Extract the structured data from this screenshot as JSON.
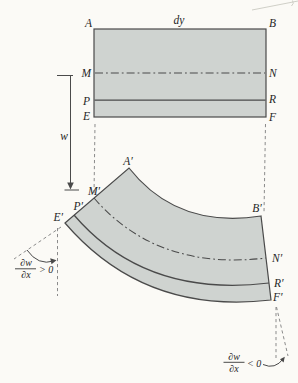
{
  "figure_labels": {
    "undeformed": {
      "A": "A",
      "dy": "dy",
      "B": "B",
      "M": "M",
      "N": "N",
      "P": "P",
      "R": "R",
      "E": "E",
      "F": "F"
    },
    "deflection": {
      "w": "w"
    },
    "deformed": {
      "A_prime": "A′",
      "B_prime": "B′",
      "M_prime": "M′",
      "N_prime": "N′",
      "P_prime": "P′",
      "R_prime": "R′",
      "E_prime": "E′",
      "F_prime": "F′"
    },
    "slope_left": {
      "numerator": "∂w",
      "denominator": "∂x",
      "comparison": "> 0"
    },
    "slope_right": {
      "numerator": "∂w",
      "denominator": "∂x",
      "comparison": "< 0"
    }
  },
  "colors": {
    "paper_bg": "#fbfaf6",
    "plate_fill": "#cfd3d0",
    "plate_edge": "#4a4a4a",
    "guide_dash": "#8b8b8b",
    "label_text": "#262626"
  }
}
